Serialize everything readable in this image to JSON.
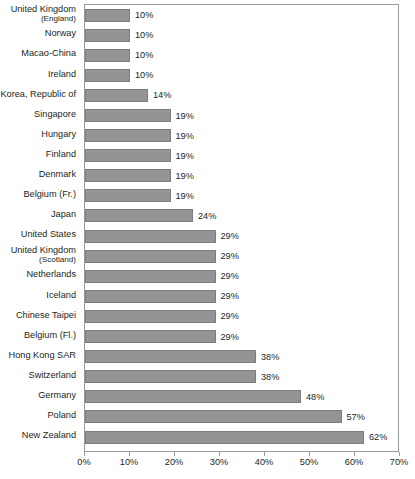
{
  "chart_data": {
    "type": "bar",
    "orientation": "horizontal",
    "title": "",
    "subtitle": "",
    "xlabel": "",
    "ylabel": "",
    "xlim": [
      0,
      70
    ],
    "xunit": "%",
    "grid": false,
    "legend": null,
    "value_label_suffix": "%",
    "xticks": [
      {
        "value": 0,
        "label": "0%"
      },
      {
        "value": 10,
        "label": "10%"
      },
      {
        "value": 20,
        "label": "20%"
      },
      {
        "value": 30,
        "label": "30%"
      },
      {
        "value": 40,
        "label": "40%"
      },
      {
        "value": 50,
        "label": "50%"
      },
      {
        "value": 60,
        "label": "60%"
      },
      {
        "value": 70,
        "label": "70%"
      }
    ],
    "bar_color": "#949494",
    "bar_border_color": "#7d7d7d",
    "categories": [
      "United Kingdom (England)",
      "Norway",
      "Macao-China",
      "Ireland",
      "Korea, Republic of",
      "Singapore",
      "Hungary",
      "Finland",
      "Denmark",
      "Belgium (Fr.)",
      "Japan",
      "United States",
      "United Kingdom (Scotland)",
      "Netherlands",
      "Iceland",
      "Chinese Taipei",
      "Belgium (Fl.)",
      "Hong Kong SAR",
      "Switzerland",
      "Germany",
      "Poland",
      "New Zealand"
    ],
    "values": [
      10,
      10,
      10,
      10,
      14,
      19,
      19,
      19,
      19,
      19,
      24,
      29,
      29,
      29,
      29,
      29,
      29,
      38,
      38,
      48,
      57,
      62
    ],
    "rows": [
      {
        "label_main": "United Kingdom",
        "label_sub": "(England)",
        "value": 10,
        "value_label": "10%"
      },
      {
        "label_main": "Norway",
        "label_sub": "",
        "value": 10,
        "value_label": "10%"
      },
      {
        "label_main": "Macao-China",
        "label_sub": "",
        "value": 10,
        "value_label": "10%"
      },
      {
        "label_main": "Ireland",
        "label_sub": "",
        "value": 10,
        "value_label": "10%"
      },
      {
        "label_main": "Korea, Republic of",
        "label_sub": "",
        "value": 14,
        "value_label": "14%"
      },
      {
        "label_main": "Singapore",
        "label_sub": "",
        "value": 19,
        "value_label": "19%"
      },
      {
        "label_main": "Hungary",
        "label_sub": "",
        "value": 19,
        "value_label": "19%"
      },
      {
        "label_main": "Finland",
        "label_sub": "",
        "value": 19,
        "value_label": "19%"
      },
      {
        "label_main": "Denmark",
        "label_sub": "",
        "value": 19,
        "value_label": "19%"
      },
      {
        "label_main": "Belgium (Fr.)",
        "label_sub": "",
        "value": 19,
        "value_label": "19%"
      },
      {
        "label_main": "Japan",
        "label_sub": "",
        "value": 24,
        "value_label": "24%"
      },
      {
        "label_main": "United States",
        "label_sub": "",
        "value": 29,
        "value_label": "29%"
      },
      {
        "label_main": "United Kingdom",
        "label_sub": "(Scotland)",
        "value": 29,
        "value_label": "29%"
      },
      {
        "label_main": "Netherlands",
        "label_sub": "",
        "value": 29,
        "value_label": "29%"
      },
      {
        "label_main": "Iceland",
        "label_sub": "",
        "value": 29,
        "value_label": "29%"
      },
      {
        "label_main": "Chinese Taipei",
        "label_sub": "",
        "value": 29,
        "value_label": "29%"
      },
      {
        "label_main": "Belgium (Fl.)",
        "label_sub": "",
        "value": 29,
        "value_label": "29%"
      },
      {
        "label_main": "Hong Kong SAR",
        "label_sub": "",
        "value": 38,
        "value_label": "38%"
      },
      {
        "label_main": "Switzerland",
        "label_sub": "",
        "value": 38,
        "value_label": "38%"
      },
      {
        "label_main": "Germany",
        "label_sub": "",
        "value": 48,
        "value_label": "48%"
      },
      {
        "label_main": "Poland",
        "label_sub": "",
        "value": 57,
        "value_label": "57%"
      },
      {
        "label_main": "New Zealand",
        "label_sub": "",
        "value": 62,
        "value_label": "62%"
      }
    ]
  }
}
